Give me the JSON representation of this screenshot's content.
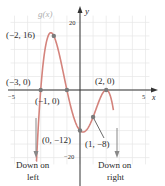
{
  "chart_data": {
    "type": "line",
    "title": "",
    "function_label": "g(x)",
    "xlabel": "x",
    "ylabel": "y",
    "xlim": [
      -5,
      5
    ],
    "ylim": [
      -20,
      20
    ],
    "x_ticks": [
      {
        "value": -5,
        "label": "−5"
      },
      {
        "value": 5,
        "label": "5"
      }
    ],
    "y_ticks": [
      {
        "value": 20,
        "label": "20"
      },
      {
        "value": -20,
        "label": "−20"
      }
    ],
    "grid": true,
    "curve_color": "#d4837c",
    "point_color": "#7a7a7a",
    "points": [
      {
        "x": -3,
        "y": 0,
        "label": "(−3, 0)"
      },
      {
        "x": -2,
        "y": 16,
        "label": "(−2, 16)"
      },
      {
        "x": -1,
        "y": 0,
        "label": "(−1, 0)"
      },
      {
        "x": 0,
        "y": -12,
        "label": "(0, −12)"
      },
      {
        "x": 1,
        "y": -8,
        "label": "(1, −8)"
      },
      {
        "x": 2,
        "y": 0,
        "label": "(2, 0)"
      }
    ],
    "curve_x_range": [
      -3.35,
      2.55
    ],
    "end_behavior": {
      "left": "Down on left",
      "right": "Down on right"
    }
  },
  "labels": {
    "func": "g(x)",
    "x_axis": "x",
    "y_axis": "y",
    "tick_x_neg5": "−5",
    "tick_x_5": "5",
    "tick_y_20": "20",
    "tick_y_neg20": "−20",
    "pt_m3": "(−3, 0)",
    "pt_m2": "(−2, 16)",
    "pt_m1": "(−1, 0)",
    "pt_0": "(0, −12)",
    "pt_1": "(1, −8)",
    "pt_2": "(2, 0)",
    "left_line1": "Down on",
    "left_line2": "left",
    "right_line1": "Down on",
    "right_line2": "right"
  }
}
